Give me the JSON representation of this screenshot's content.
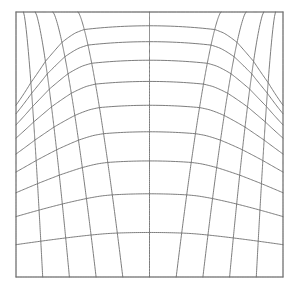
{
  "figure": {
    "title": "Curvilinear deformed mesh grid",
    "background_color": "#ffffff"
  },
  "frame": {
    "x": 16,
    "y": 12,
    "width": 267,
    "height": 265,
    "stroke_color": "#9a9a9a",
    "stroke_width": 1.0
  },
  "mesh": {
    "columns": 10,
    "rows": 10,
    "vertical_line_count": 11,
    "horizontal_line_count": 11,
    "stroke_color": "#6e6e6e",
    "stroke_width": 0.9,
    "peak_x_fraction": 0.5,
    "notes": "Grid generated from a normalized parametric warp; u runs left to right, v runs top to bottom."
  },
  "chart_data": {
    "type": "line",
    "title": "Curvilinear deformed mesh grid",
    "subtitle": "",
    "xlabel": "",
    "ylabel": "",
    "xlim": [
      0,
      1
    ],
    "ylim": [
      0,
      1
    ],
    "grid": false,
    "legend_position": "none",
    "tick_labels_x": [],
    "tick_labels_y": [],
    "annotations": [],
    "u_nodes": [
      0.0,
      0.1,
      0.2,
      0.3,
      0.4,
      0.5,
      0.6,
      0.7,
      0.8,
      0.9,
      1.0
    ],
    "v_nodes": [
      0.0,
      0.1,
      0.2,
      0.3,
      0.4,
      0.5,
      0.6,
      0.7,
      0.8,
      0.9,
      1.0
    ],
    "row_depth_profile": [
      0.0,
      0.052,
      0.112,
      0.182,
      0.262,
      0.352,
      0.452,
      0.562,
      0.686,
      0.832,
      1.0
    ],
    "row_sag_amplitude": [
      0.0,
      0.3,
      0.272,
      0.244,
      0.214,
      0.184,
      0.152,
      0.12,
      0.086,
      0.046,
      0.0
    ],
    "column_spread_top": [
      0.0,
      0.028,
      0.072,
      0.138,
      0.232,
      0.5,
      0.768,
      0.862,
      0.928,
      0.972,
      1.0
    ],
    "column_spread_bottom": [
      0.0,
      0.1,
      0.2,
      0.3,
      0.4,
      0.5,
      0.6,
      0.7,
      0.8,
      0.9,
      1.0
    ],
    "series": [
      {
        "name": "horizontal-grid-lines",
        "orientation": "horizontal",
        "count": 11,
        "values": [
          0.0,
          0.052,
          0.112,
          0.182,
          0.262,
          0.352,
          0.452,
          0.562,
          0.686,
          0.832,
          1.0
        ]
      },
      {
        "name": "vertical-grid-lines",
        "orientation": "vertical",
        "count": 11,
        "values": [
          0.0,
          0.1,
          0.2,
          0.3,
          0.4,
          0.5,
          0.6,
          0.7,
          0.8,
          0.9,
          1.0
        ]
      }
    ]
  }
}
